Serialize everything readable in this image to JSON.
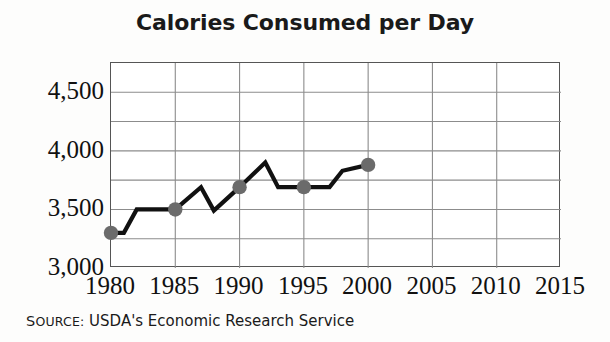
{
  "title": "Calories Consumed per Day",
  "source": {
    "label_cap": "S",
    "label_rest": "OURCE:",
    "text": "USDA's Economic Research Service"
  },
  "style": {
    "line_color": "#111111",
    "marker_color": "#6b6b6b",
    "grid_color": "#8c8c8c",
    "frame_color": "#555555",
    "background": "#ffffff",
    "title_color": "#1a1a1a"
  },
  "chart_data": {
    "type": "line",
    "title": "Calories Consumed per Day",
    "xlabel": "",
    "ylabel": "",
    "xlim": [
      1980,
      2015
    ],
    "ylim": [
      3000,
      4750
    ],
    "grid": true,
    "legend": "none",
    "xticks": [
      1980,
      1985,
      1990,
      1995,
      2000,
      2005,
      2010,
      2015
    ],
    "xtick_labels": [
      "1980",
      "1985",
      "1990",
      "1995",
      "2000",
      "2005",
      "2010",
      "2015"
    ],
    "yticks": [
      3000,
      3500,
      4000,
      4500
    ],
    "ytick_labels": [
      "3,000",
      "3,500",
      "4,000",
      "4,500"
    ],
    "y_gridline_step": 250,
    "y_gridlines": [
      3000,
      3250,
      3500,
      3750,
      4000,
      4250,
      4500,
      4750
    ],
    "series": [
      {
        "name": "Calories consumed per day",
        "x": [
          1980,
          1981,
          1982,
          1985,
          1987,
          1988,
          1990,
          1992,
          1993,
          1995,
          1997,
          1998,
          2000
        ],
        "values": [
          3300,
          3300,
          3500,
          3500,
          3690,
          3490,
          3690,
          3900,
          3690,
          3690,
          3690,
          3830,
          3880
        ],
        "marker_x": [
          1980,
          1985,
          1990,
          1995,
          2000
        ],
        "marker_values": [
          3300,
          3500,
          3690,
          3690,
          3880
        ]
      }
    ]
  }
}
